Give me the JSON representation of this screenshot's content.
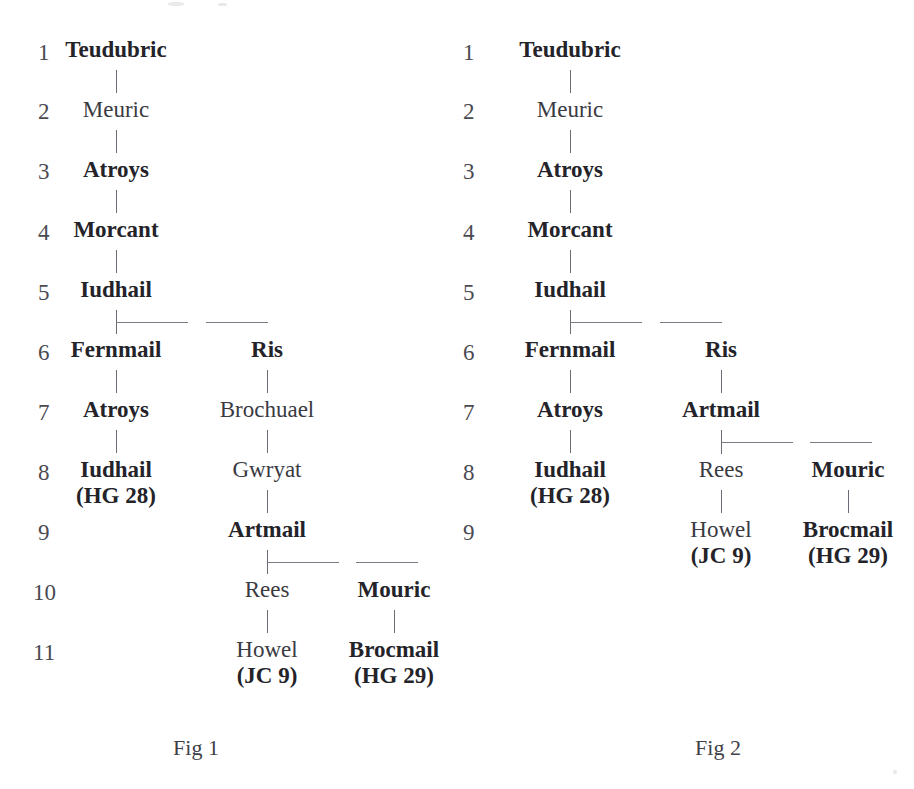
{
  "page": {
    "background_color": "#ffffff",
    "text_color": "#2b2b31",
    "line_color": "#7a7a84"
  },
  "figures": [
    {
      "id": "fig-1",
      "caption": "Fig 1",
      "generation_numbers": [
        "1",
        "2",
        "3",
        "4",
        "5",
        "6",
        "7",
        "8",
        "9",
        "10",
        "11"
      ],
      "nodes": [
        {
          "key": "teudubric",
          "name": "Teudubric",
          "ref": "",
          "generation": "1",
          "style": "bold",
          "branch": "main"
        },
        {
          "key": "meuric",
          "name": "Meuric",
          "ref": "",
          "generation": "2",
          "style": "plain",
          "branch": "main"
        },
        {
          "key": "atroys3",
          "name": "Atroys",
          "ref": "",
          "generation": "3",
          "style": "bold",
          "branch": "main"
        },
        {
          "key": "morcant",
          "name": "Morcant",
          "ref": "",
          "generation": "4",
          "style": "bold",
          "branch": "main"
        },
        {
          "key": "iudhail5",
          "name": "Iudhail",
          "ref": "",
          "generation": "5",
          "style": "bold",
          "branch": "main"
        },
        {
          "key": "fernmail",
          "name": "Fernmail",
          "ref": "",
          "generation": "6",
          "style": "bold",
          "branch": "left"
        },
        {
          "key": "ris",
          "name": "Ris",
          "ref": "",
          "generation": "6",
          "style": "bold",
          "branch": "middle"
        },
        {
          "key": "atroys7",
          "name": "Atroys",
          "ref": "",
          "generation": "7",
          "style": "bold",
          "branch": "left"
        },
        {
          "key": "brochuael",
          "name": "Brochuael",
          "ref": "",
          "generation": "7",
          "style": "plain",
          "branch": "middle"
        },
        {
          "key": "iudhail8",
          "name": "Iudhail",
          "ref": "(HG 28)",
          "generation": "8",
          "style": "bold",
          "branch": "left"
        },
        {
          "key": "gwryat",
          "name": "Gwryat",
          "ref": "",
          "generation": "8",
          "style": "plain",
          "branch": "middle"
        },
        {
          "key": "artmail",
          "name": "Artmail",
          "ref": "",
          "generation": "9",
          "style": "bold",
          "branch": "middle"
        },
        {
          "key": "rees",
          "name": "Rees",
          "ref": "",
          "generation": "10",
          "style": "plain",
          "branch": "middle"
        },
        {
          "key": "mouric",
          "name": "Mouric",
          "ref": "",
          "generation": "10",
          "style": "bold",
          "branch": "right"
        },
        {
          "key": "howel",
          "name": "Howel",
          "ref": "(JC 9)",
          "generation": "11",
          "style": "plain",
          "branch": "middle"
        },
        {
          "key": "brocmail",
          "name": "Brocmail",
          "ref": "(HG 29)",
          "generation": "11",
          "style": "bold",
          "branch": "right"
        }
      ]
    },
    {
      "id": "fig-2",
      "caption": "Fig 2",
      "generation_numbers": [
        "1",
        "2",
        "3",
        "4",
        "5",
        "6",
        "7",
        "8",
        "9"
      ],
      "nodes": [
        {
          "key": "teudubric",
          "name": "Teudubric",
          "ref": "",
          "generation": "1",
          "style": "bold",
          "branch": "main"
        },
        {
          "key": "meuric",
          "name": "Meuric",
          "ref": "",
          "generation": "2",
          "style": "plain",
          "branch": "main"
        },
        {
          "key": "atroys3",
          "name": "Atroys",
          "ref": "",
          "generation": "3",
          "style": "bold",
          "branch": "main"
        },
        {
          "key": "morcant",
          "name": "Morcant",
          "ref": "",
          "generation": "4",
          "style": "bold",
          "branch": "main"
        },
        {
          "key": "iudhail5",
          "name": "Iudhail",
          "ref": "",
          "generation": "5",
          "style": "bold",
          "branch": "main"
        },
        {
          "key": "fernmail",
          "name": "Fernmail",
          "ref": "",
          "generation": "6",
          "style": "bold",
          "branch": "left"
        },
        {
          "key": "ris",
          "name": "Ris",
          "ref": "",
          "generation": "6",
          "style": "bold",
          "branch": "middle"
        },
        {
          "key": "atroys7",
          "name": "Atroys",
          "ref": "",
          "generation": "7",
          "style": "bold",
          "branch": "left"
        },
        {
          "key": "artmail",
          "name": "Artmail",
          "ref": "",
          "generation": "7",
          "style": "bold",
          "branch": "middle"
        },
        {
          "key": "iudhail8",
          "name": "Iudhail",
          "ref": "(HG 28)",
          "generation": "8",
          "style": "bold",
          "branch": "left"
        },
        {
          "key": "rees",
          "name": "Rees",
          "ref": "",
          "generation": "8",
          "style": "plain",
          "branch": "middle"
        },
        {
          "key": "mouric",
          "name": "Mouric",
          "ref": "",
          "generation": "8",
          "style": "bold",
          "branch": "right"
        },
        {
          "key": "howel",
          "name": "Howel",
          "ref": "(JC 9)",
          "generation": "9",
          "style": "plain",
          "branch": "middle"
        },
        {
          "key": "brocmail",
          "name": "Brocmail",
          "ref": "(HG 29)",
          "generation": "9",
          "style": "bold",
          "branch": "right"
        }
      ]
    }
  ]
}
